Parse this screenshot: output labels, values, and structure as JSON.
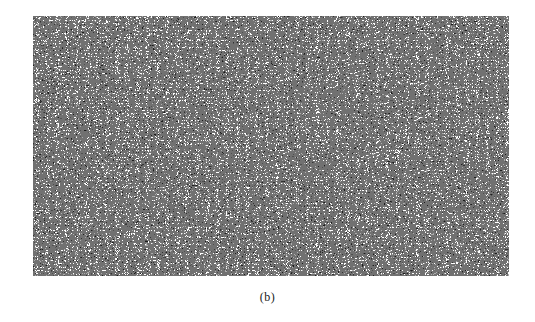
{
  "figure": {
    "caption": "(b)",
    "panel": {
      "content": "speckle-noise-texture",
      "foreground_color": "#111111",
      "background_color": "#ffffff"
    }
  }
}
